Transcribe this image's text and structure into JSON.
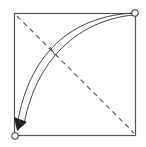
{
  "diagram": {
    "type": "origami-fold-instruction",
    "square": {
      "x": 14,
      "y": 13,
      "size": 122,
      "stroke": "#555555"
    },
    "diagonal": {
      "style": "dashed",
      "from": "top-left",
      "to": "bottom-right",
      "meaning": "valley-fold-line"
    },
    "arrow": {
      "from": "top-right-corner",
      "to": "bottom-left-corner",
      "style": "curved-fold-arrow"
    },
    "markers": [
      {
        "name": "top-right-corner",
        "shape": "circle"
      },
      {
        "name": "bottom-left-corner",
        "shape": "circle"
      }
    ],
    "colors": {
      "line": "#555555",
      "fill": "#ffffff",
      "arrowhead": "#333333"
    }
  }
}
